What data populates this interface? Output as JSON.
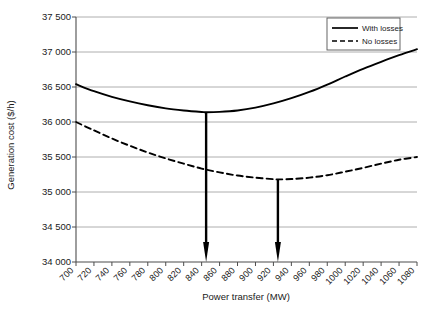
{
  "chart_data": {
    "type": "line",
    "title": "",
    "xlabel": "Power transfer (MW)",
    "ylabel": "Generation cost ($/h)",
    "xlim": [
      700,
      1080
    ],
    "ylim": [
      34000,
      37500
    ],
    "xticks": [
      700,
      720,
      740,
      760,
      780,
      800,
      820,
      840,
      860,
      880,
      900,
      920,
      940,
      960,
      980,
      1000,
      1020,
      1040,
      1060,
      1080
    ],
    "xtick_labels": [
      "700",
      "720",
      "740",
      "760",
      "780",
      "800",
      "820",
      "840",
      "860",
      "880",
      "900",
      "920",
      "940",
      "960",
      "980",
      "1000",
      "1020",
      "1040",
      "1060",
      "1080"
    ],
    "yticks": [
      34000,
      34500,
      35000,
      35500,
      36000,
      36500,
      37000,
      37500
    ],
    "ytick_labels": [
      "34 000",
      "34 500",
      "35 000",
      "35 500",
      "36 000",
      "36 500",
      "37 000",
      "37 500"
    ],
    "grid": "horizontal",
    "legend_position": "top-right",
    "series": [
      {
        "name": "With losses",
        "style": "solid",
        "color": "#000000",
        "minimum_x": 845,
        "minimum_y": 36140,
        "x": [
          700,
          720,
          740,
          760,
          780,
          800,
          820,
          840,
          845,
          860,
          880,
          900,
          920,
          940,
          960,
          980,
          1000,
          1020,
          1040,
          1060,
          1080
        ],
        "values": [
          36540,
          36440,
          36360,
          36295,
          36240,
          36195,
          36165,
          36143,
          36140,
          36145,
          36165,
          36205,
          36265,
          36340,
          36430,
          36535,
          36650,
          36760,
          36860,
          36955,
          37040
        ]
      },
      {
        "name": "No losses",
        "style": "dashed",
        "color": "#000000",
        "minimum_x": 925,
        "minimum_y": 35180,
        "x": [
          700,
          720,
          740,
          760,
          780,
          800,
          820,
          840,
          860,
          880,
          900,
          920,
          925,
          940,
          960,
          980,
          1000,
          1020,
          1040,
          1060,
          1080
        ],
        "values": [
          36000,
          35880,
          35765,
          35660,
          35565,
          35480,
          35405,
          35335,
          35280,
          35235,
          35205,
          35183,
          35180,
          35185,
          35205,
          35240,
          35290,
          35345,
          35405,
          35460,
          35500
        ]
      }
    ],
    "annotations": [
      {
        "name": "with-losses-optimum-arrow",
        "x": 845,
        "y_from": 36140,
        "y_to": 34000
      },
      {
        "name": "no-losses-optimum-arrow",
        "x": 925,
        "y_from": 35180,
        "y_to": 34000
      }
    ]
  },
  "legend": {
    "entries": [
      {
        "label": "With losses"
      },
      {
        "label": "No losses"
      }
    ]
  },
  "axes": {
    "x_title": "Power transfer (MW)",
    "y_title": "Generation cost ($/h)"
  }
}
